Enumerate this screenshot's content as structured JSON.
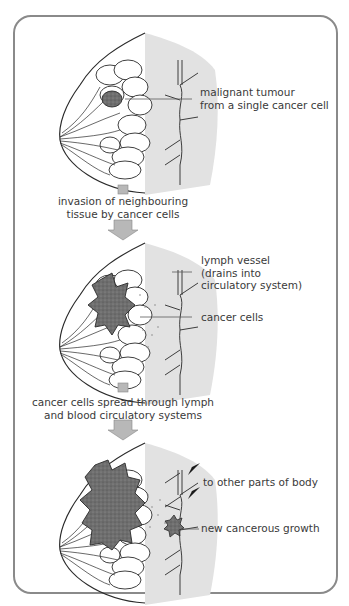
{
  "figure": {
    "stages": [
      {
        "id": "stage1",
        "labels": [
          {
            "line1": "malignant tumour",
            "line2": "from a single cancer cell"
          }
        ]
      },
      {
        "id": "stage2",
        "transition": {
          "line1": "invasion of neighbouring",
          "line2": "tissue by cancer cells"
        },
        "labels": [
          {
            "line1": "lymph vessel",
            "line2": "(drains into",
            "line3": "circulatory system)"
          },
          {
            "line1": "cancer cells"
          }
        ]
      },
      {
        "id": "stage3",
        "transition": {
          "line1": "cancer cells spread through lymph",
          "line2": "and blood circulatory systems"
        },
        "labels": [
          {
            "line1": "to other parts of body"
          },
          {
            "line1": "new cancerous growth"
          }
        ]
      }
    ],
    "colors": {
      "frame": "#8a8a8a",
      "tissue_shade": "#e2e2e2",
      "tumour": "#6e6e6e",
      "arrow": "#b8b8b8",
      "line": "#2a2a2a"
    }
  }
}
